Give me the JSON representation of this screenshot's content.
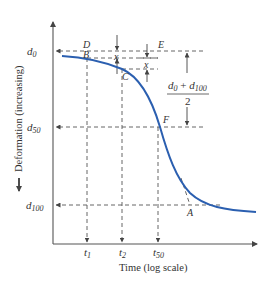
{
  "figure": {
    "x_axis_label": "Time (log scale)",
    "y_axis_label": "Deformation (increasing)",
    "curve_color": "#2b5fb0",
    "y_ticks": [
      {
        "label": "d",
        "sub": "0"
      },
      {
        "label": "d",
        "sub": "50"
      },
      {
        "label": "d",
        "sub": "100"
      }
    ],
    "x_ticks": [
      {
        "label": "t",
        "sub": "1"
      },
      {
        "label": "t",
        "sub": "2"
      },
      {
        "label": "t",
        "sub": "50"
      }
    ],
    "points": {
      "A": "A",
      "B": "B",
      "C": "C",
      "D": "D",
      "E": "E",
      "F": "F"
    },
    "offset_label": "x",
    "fraction": {
      "numerator_a": "d",
      "numerator_a_sub": "0",
      "plus": " + ",
      "numerator_b": "d",
      "numerator_b_sub": "100",
      "denominator": "2"
    }
  }
}
